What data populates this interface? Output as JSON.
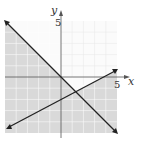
{
  "graph": {
    "x_axis_label": "x",
    "y_axis_label": "y",
    "x_tick_label": "5",
    "y_tick_label": "5",
    "range": {
      "xmin": -5,
      "xmax": 5,
      "ymin": -5,
      "ymax": 5
    },
    "lines": [
      {
        "name": "line-1",
        "equation": "y = -x",
        "slope": -1,
        "intercept": 0
      },
      {
        "name": "line-2",
        "equation": "y = x/2 - 2",
        "slope": 0.5,
        "intercept": -2
      }
    ],
    "shaded_region": "all except region above both lines",
    "colors": {
      "shade": "#d9d9d9",
      "line": "#222222",
      "grid": "#ffffff",
      "axis": "#555555"
    }
  }
}
